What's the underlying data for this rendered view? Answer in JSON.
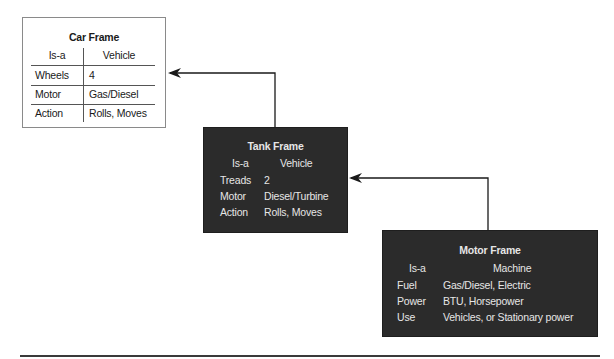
{
  "frames": {
    "car": {
      "title": "Car Frame",
      "isa_label": "Is-a",
      "isa_value": "Vehicle",
      "rows": [
        {
          "key": "Wheels",
          "value": "4"
        },
        {
          "key": "Motor",
          "value": "Gas/Diesel"
        },
        {
          "key": "Action",
          "value": "Rolls, Moves"
        }
      ]
    },
    "tank": {
      "title": "Tank Frame",
      "isa_label": "Is-a",
      "isa_value": "Vehicle",
      "rows": [
        {
          "key": "Treads",
          "value": "2"
        },
        {
          "key": "Motor",
          "value": "Diesel/Turbine"
        },
        {
          "key": "Action",
          "value": "Rolls, Moves"
        }
      ]
    },
    "motor": {
      "title": "Motor Frame",
      "isa_label": "Is-a",
      "isa_value": "Machine",
      "rows": [
        {
          "key": "Fuel",
          "value": "Gas/Diesel, Electric"
        },
        {
          "key": "Power",
          "value": "BTU, Horsepower"
        },
        {
          "key": "Use",
          "value": "Vehicles, or Stationary power"
        }
      ]
    }
  },
  "connections": [
    {
      "from": "Tank Frame",
      "to": "Car Frame"
    },
    {
      "from": "Motor Frame",
      "to": "Tank Frame"
    }
  ],
  "colors": {
    "dark_frame": "#2b2b2b",
    "light_frame_border": "#8a8a8a",
    "connector": "#1a1a1a"
  }
}
